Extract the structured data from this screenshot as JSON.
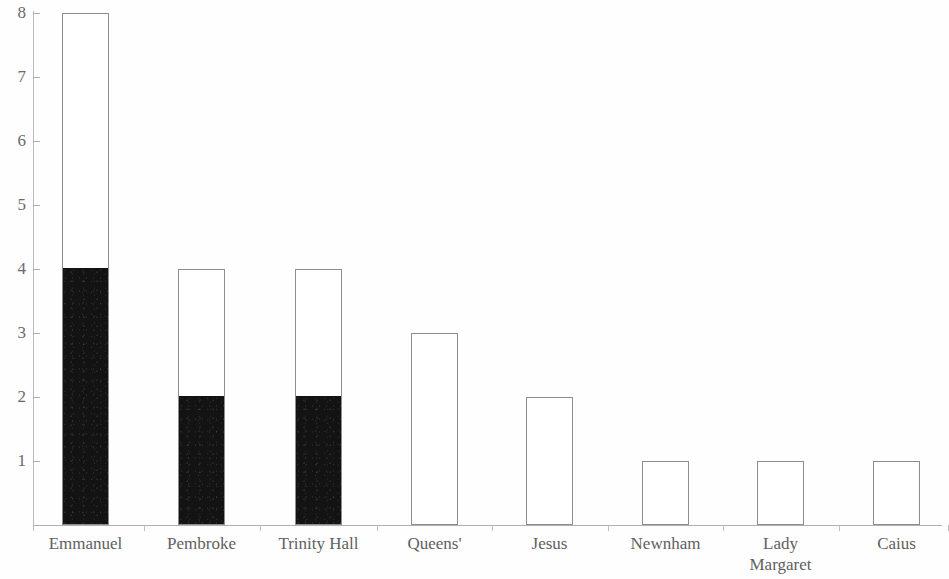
{
  "chart_data": {
    "type": "bar",
    "subtype": "stacked-bar",
    "title": "",
    "subtitle": "",
    "xlabel": "",
    "ylabel": "",
    "ylim": [
      0,
      8
    ],
    "yticks": [
      0,
      1,
      2,
      3,
      4,
      5,
      6,
      7,
      8
    ],
    "ytick_labels": [
      "1",
      "2",
      "3",
      "4",
      "5",
      "6",
      "7",
      "8"
    ],
    "grid": false,
    "legend": false,
    "legend_position": "none",
    "categories": [
      "Emmanuel",
      "Pembroke",
      "Trinity Hall",
      "Queens'",
      "Jesus",
      "Newnham",
      "Lady\nMargaret",
      "Caius"
    ],
    "totals": [
      8,
      4,
      4,
      3,
      2,
      1,
      1,
      1
    ],
    "series": [
      {
        "name": "filled",
        "color": "#131313",
        "values": [
          4,
          2,
          2,
          0,
          0,
          0,
          0,
          0
        ]
      },
      {
        "name": "unfilled",
        "color": "#ffffff",
        "values": [
          4,
          2,
          2,
          3,
          2,
          1,
          1,
          1
        ]
      }
    ],
    "bars": [
      {
        "category": "Emmanuel",
        "total": 8,
        "filled": 4,
        "unfilled": 4,
        "x": 62,
        "width": 47
      },
      {
        "category": "Pembroke",
        "total": 4,
        "filled": 2,
        "unfilled": 2,
        "x": 178,
        "width": 47
      },
      {
        "category": "Trinity Hall",
        "total": 4,
        "filled": 2,
        "unfilled": 2,
        "x": 295,
        "width": 47
      },
      {
        "category": "Queens'",
        "total": 3,
        "filled": 0,
        "unfilled": 3,
        "x": 411,
        "width": 47
      },
      {
        "category": "Jesus",
        "total": 2,
        "filled": 0,
        "unfilled": 2,
        "x": 526,
        "width": 47
      },
      {
        "category": "Newnham",
        "total": 1,
        "filled": 0,
        "unfilled": 1,
        "x": 642,
        "width": 47
      },
      {
        "category": "Lady Margaret",
        "total": 1,
        "filled": 0,
        "unfilled": 1,
        "x": 757,
        "width": 47
      },
      {
        "category": "Caius",
        "total": 1,
        "filled": 0,
        "unfilled": 1,
        "x": 873,
        "width": 47
      }
    ]
  },
  "axis": {
    "y_labels": [
      "8",
      "7",
      "6",
      "5",
      "4",
      "3",
      "2",
      "1"
    ],
    "y_label_values": [
      8,
      7,
      6,
      5,
      4,
      3,
      2,
      1
    ],
    "baseline_value": 0
  },
  "labels": {
    "cat_0": "Emmanuel",
    "cat_1": "Pembroke",
    "cat_2": "Trinity Hall",
    "cat_3": "Queens'",
    "cat_4": "Jesus",
    "cat_5": "Newnham",
    "cat_6": "Lady\nMargaret",
    "cat_7": "Caius"
  },
  "colors": {
    "background": "#fefefe",
    "bar_outline": "#8d8d8d",
    "bar_fill": "#131313",
    "bar_empty": "#ffffff",
    "axis_line": "#b0b0b0",
    "text": "#606060"
  }
}
